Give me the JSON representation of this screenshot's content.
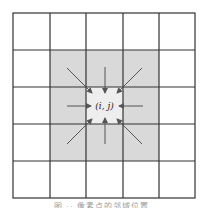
{
  "diagram": {
    "grid": {
      "rows": 5,
      "cols": 5,
      "origin_x": 13,
      "origin_y": 13,
      "cell": 36.6,
      "line_color": "#333333"
    },
    "shaded_region": {
      "row_start": 1,
      "col_start": 1,
      "rows": 3,
      "cols": 3,
      "fill": "#d9d9d9"
    },
    "center_cell": {
      "row": 2,
      "col": 2,
      "fill": "#eeeeee",
      "label": "(i, j)"
    },
    "arrows": {
      "count": 8,
      "directions": [
        "from-top-left",
        "from-top",
        "from-top-right",
        "from-left",
        "from-right",
        "from-bottom-left",
        "from-bottom",
        "from-bottom-right"
      ],
      "color": "#555555"
    }
  },
  "caption": {
    "text": "图 ·· 像素点的邻域位置"
  }
}
